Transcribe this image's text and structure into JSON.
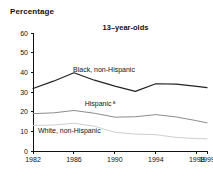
{
  "axis_title": "Percentage",
  "chart_data": {
    "type": "line",
    "title": "13–year-olds",
    "xlabel": "",
    "ylabel": "Percentage",
    "ylim": [
      0,
      60
    ],
    "xlim": [
      1982,
      1999
    ],
    "grid": false,
    "legend_position": "inline-labels",
    "y_ticks": [
      "0",
      "10",
      "20",
      "30",
      "40",
      "50",
      "60"
    ],
    "x_ticks": [
      "1982",
      "1986",
      "1990",
      "1994",
      "1998",
      "1999"
    ],
    "x": [
      1982,
      1984,
      1986,
      1988,
      1990,
      1992,
      1994,
      1996,
      1998,
      1999
    ],
    "series": [
      {
        "name": "Black, non-Hispanic",
        "label": "Black, non-Hispanic",
        "color": "#222222",
        "values": [
          31.8,
          35.5,
          39.8,
          36.0,
          33.0,
          30.3,
          34.2,
          34.0,
          32.9,
          32.2
        ]
      },
      {
        "name": "Hispanic",
        "label": "Hispanic",
        "label_superscript": "a",
        "color": "#8c8c8c",
        "values": [
          19.0,
          19.4,
          20.6,
          19.2,
          17.2,
          17.4,
          18.5,
          17.3,
          15.4,
          14.3
        ]
      },
      {
        "name": "White, non-Hispanic",
        "label": "White, non-Hispanic",
        "color": "#cfcfcf",
        "values": [
          13.0,
          13.2,
          14.1,
          12.6,
          9.5,
          8.6,
          8.3,
          6.9,
          6.3,
          6.2
        ]
      }
    ]
  }
}
